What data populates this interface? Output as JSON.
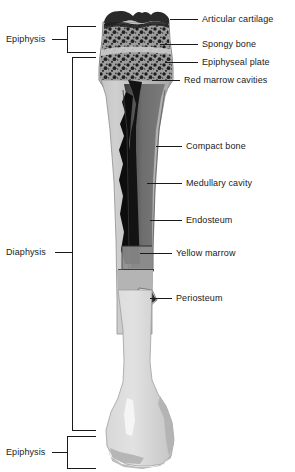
{
  "figure": {
    "background_color": "#ffffff",
    "text_color": "#1a1a1a"
  },
  "region_labels": [
    {
      "id": "epiphysis-proximal",
      "label": "Epiphysis",
      "side": "left",
      "x": 6,
      "y": 38
    },
    {
      "id": "diaphysis",
      "label": "Diaphysis",
      "side": "left",
      "x": 6,
      "y": 248
    },
    {
      "id": "epiphysis-distal",
      "label": "Epiphysis",
      "side": "left",
      "x": 6,
      "y": 443
    }
  ],
  "structure_labels": [
    {
      "id": "articular-cartilage",
      "label": "Articular cartilage",
      "side": "right",
      "x": 202,
      "y": 14
    },
    {
      "id": "spongy-bone",
      "label": "Spongy bone",
      "side": "right",
      "x": 202,
      "y": 40
    },
    {
      "id": "epiphyseal-plate",
      "label": "Epiphyseal plate",
      "side": "right",
      "x": 202,
      "y": 58
    },
    {
      "id": "red-marrow-cavities",
      "label": "Red marrow cavities",
      "side": "right",
      "x": 184,
      "y": 76
    },
    {
      "id": "compact-bone",
      "label": "Compact bone",
      "side": "right",
      "x": 186,
      "y": 142
    },
    {
      "id": "medullary-cavity",
      "label": "Medullary cavity",
      "side": "right",
      "x": 186,
      "y": 179
    },
    {
      "id": "endosteum",
      "label": "Endosteum",
      "side": "right",
      "x": 186,
      "y": 216
    },
    {
      "id": "yellow-marrow",
      "label": "Yellow marrow",
      "side": "right",
      "x": 176,
      "y": 249
    },
    {
      "id": "periosteum",
      "label": "Periosteum",
      "side": "right",
      "x": 176,
      "y": 294
    }
  ],
  "colors": {
    "line": "#1a1a1a",
    "articular_cartilage": "#2b2b2b",
    "spongy_bone": "#9a9a9a",
    "compact_bone": "#b9b9b9",
    "medullary_cavity": "#6f6f6f",
    "red_marrow": "#141414",
    "yellow_marrow": "#8d8d8d",
    "periosteum_flap": "#efefef",
    "distal_bone": "#cfcfcf",
    "outline": "#7d7d7d"
  }
}
